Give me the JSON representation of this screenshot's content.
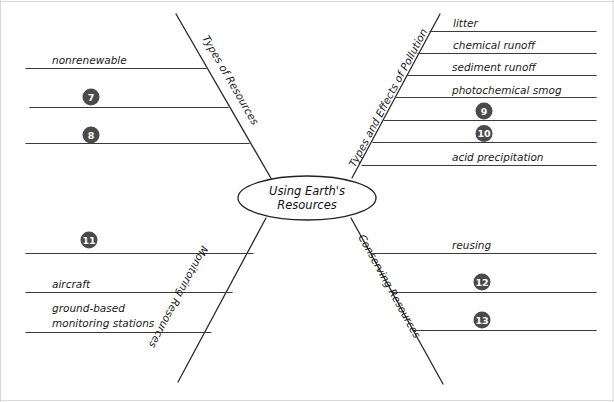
{
  "diagram": {
    "type": "concept-map-fishbone",
    "center": {
      "line1": "Using Earth's",
      "line2": "Resources"
    },
    "branches": [
      {
        "id": "types-of-resources",
        "label": "Types of Resources",
        "position": "upper-left",
        "entries": [
          {
            "slot": 1,
            "kind": "text",
            "text": "nonrenewable"
          },
          {
            "slot": 2,
            "kind": "number",
            "text": "7"
          },
          {
            "slot": 3,
            "kind": "number",
            "text": "8"
          }
        ]
      },
      {
        "id": "types-and-effects-of-pollution",
        "label": "Types and Effects of Pollution",
        "position": "upper-right",
        "entries": [
          {
            "slot": 1,
            "kind": "text",
            "text": "litter"
          },
          {
            "slot": 2,
            "kind": "text",
            "text": "chemical runoff"
          },
          {
            "slot": 3,
            "kind": "text",
            "text": "sediment runoff"
          },
          {
            "slot": 4,
            "kind": "text",
            "text": "photochemical smog"
          },
          {
            "slot": 5,
            "kind": "number",
            "text": "9"
          },
          {
            "slot": 6,
            "kind": "number",
            "text": "10"
          },
          {
            "slot": 7,
            "kind": "text",
            "text": "acid precipitation"
          }
        ]
      },
      {
        "id": "monitoring-resources",
        "label": "Monitoring Resources",
        "position": "lower-left",
        "entries": [
          {
            "slot": 1,
            "kind": "number",
            "text": "11"
          },
          {
            "slot": 2,
            "kind": "text",
            "text": "aircraft"
          },
          {
            "slot": 3,
            "kind": "text",
            "text": "ground-based",
            "text2": "monitoring stations"
          }
        ]
      },
      {
        "id": "conserving-resources",
        "label": "Conserving Resources",
        "position": "lower-right",
        "entries": [
          {
            "slot": 1,
            "kind": "text",
            "text": "reusing"
          },
          {
            "slot": 2,
            "kind": "number",
            "text": "12"
          },
          {
            "slot": 3,
            "kind": "number",
            "text": "13"
          }
        ]
      }
    ],
    "colors": {
      "background": "#ffffff",
      "line": "#3b3b3b",
      "text": "#1a1a1a",
      "number_badge_fill": "#4a4a4a",
      "number_badge_text": "#ffffff",
      "page_edge": "#d8d8d8"
    }
  }
}
